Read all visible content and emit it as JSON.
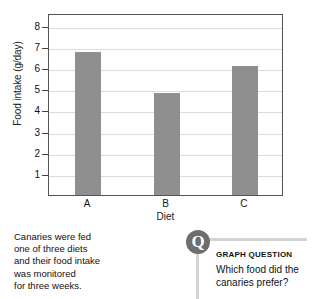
{
  "chart_data": {
    "type": "bar",
    "title": "",
    "categories": [
      "A",
      "B",
      "C"
    ],
    "values": [
      6.75,
      4.8,
      6.1
    ],
    "xlabel": "Diet",
    "ylabel": "Food intake (g/day)",
    "ylim": [
      0,
      8.6
    ],
    "yticks": [
      1,
      2,
      3,
      4,
      5,
      6,
      7,
      8
    ],
    "ytick_labels": [
      "1",
      "2",
      "3",
      "4",
      "5",
      "6",
      "7",
      "8"
    ],
    "grid": true,
    "legend": false,
    "bar_color": "#8f8f8f",
    "plot_border_color": "#555555",
    "gridline_color": "#dcdcdc"
  },
  "caption": {
    "lines": [
      "Canaries were fed",
      "one of three diets",
      "and their food intake",
      "was monitored",
      "for three weeks."
    ]
  },
  "question": {
    "badge_letter": "Q",
    "heading": "GRAPH QUESTION",
    "lines": [
      "Which food did the",
      "canaries prefer?"
    ],
    "badge_color": "#6e6e6e",
    "rule_color": "#d3d3d3"
  }
}
